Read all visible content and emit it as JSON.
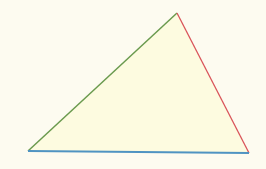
{
  "diagram": {
    "type": "triangle",
    "background": "#fdfbf0",
    "fill": "#fdfbe0",
    "vertices": {
      "top": [
        177,
        13
      ],
      "bottom_left": [
        28,
        151
      ],
      "bottom_right": [
        249,
        153
      ]
    },
    "edges": [
      {
        "name": "left-edge",
        "from": "bottom_left",
        "to": "top",
        "color": "#6a9a4e"
      },
      {
        "name": "right-edge",
        "from": "top",
        "to": "bottom_right",
        "color": "#d9545a"
      },
      {
        "name": "bottom-edge",
        "from": "bottom_left",
        "to": "bottom_right",
        "color": "#4f93c2"
      }
    ]
  }
}
